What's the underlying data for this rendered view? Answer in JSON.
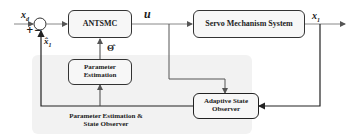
{
  "diagram": {
    "blocks": {
      "controller": "ANTSMC",
      "plant": "Servo Mechanism System",
      "param_est_line1": "Parameter",
      "param_est_line2": "Estimation",
      "observer_line1": "Adaptive State",
      "observer_line2": "Observer"
    },
    "group": {
      "line1": "Parameter Estimation &",
      "line2": "State Observer"
    },
    "signals": {
      "reference": "x",
      "reference_sub": "d",
      "control": "u",
      "output": "x",
      "output_sub": "1",
      "estimate": "x̂",
      "estimate_sub": "1",
      "theta_hat": "Θ̂",
      "plus": "+",
      "minus": "−"
    }
  }
}
